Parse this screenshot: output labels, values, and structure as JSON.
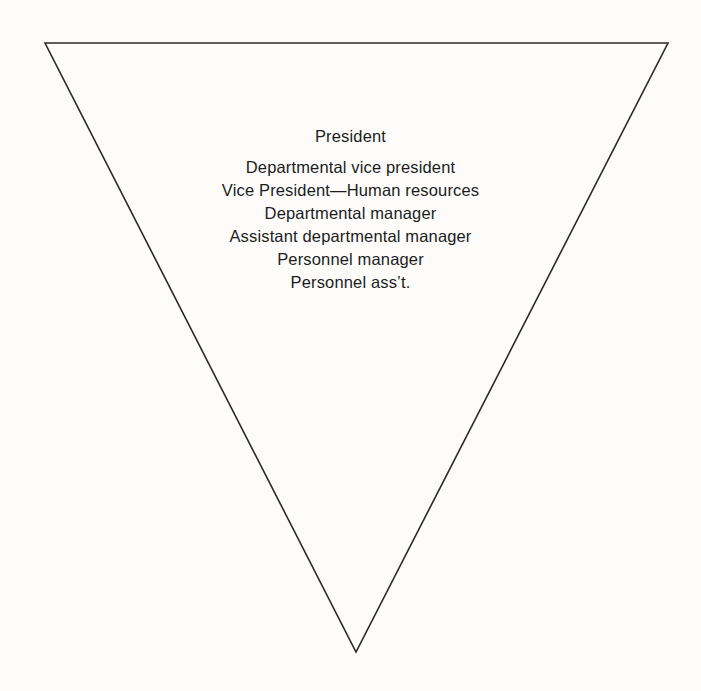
{
  "figure": {
    "name": "inverted-hierarchy-triangle",
    "background_color": "#fdfcfb",
    "stroke_color": "#2a2a2a",
    "text_color": "#1c1c1c"
  },
  "shape": {
    "type": "inverted-triangle",
    "vertices": {
      "top_left": {
        "x": 45,
        "y": 43
      },
      "top_right": {
        "x": 668,
        "y": 43
      },
      "bottom_apex": {
        "x": 356,
        "y": 652
      }
    },
    "stroke_width": 1.6,
    "fill": "none"
  },
  "hierarchy": {
    "levels": [
      {
        "rank": 1,
        "label": "President"
      },
      {
        "rank": 2,
        "label": "Departmental vice president"
      },
      {
        "rank": 3,
        "label": "Vice President—Human resources"
      },
      {
        "rank": 4,
        "label": "Departmental manager"
      },
      {
        "rank": 5,
        "label": "Assistant departmental manager"
      },
      {
        "rank": 6,
        "label": "Personnel manager"
      },
      {
        "rank": 7,
        "label": "Personnel ass’t."
      }
    ]
  }
}
